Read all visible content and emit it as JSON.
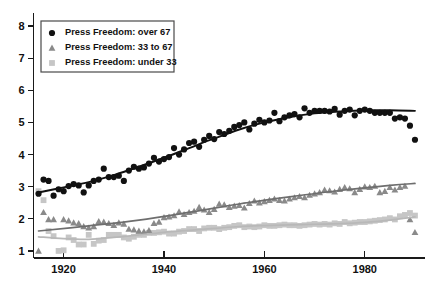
{
  "chart_data": {
    "type": "scatter",
    "title": "",
    "subtitle": "",
    "xlabel": "",
    "ylabel": "",
    "xlim": [
      1914,
      1992
    ],
    "ylim": [
      0.78,
      8.25
    ],
    "xticks": [
      1920,
      1940,
      1960,
      1980
    ],
    "xtick_labels": [
      "1920",
      "1940",
      "1960",
      "1980"
    ],
    "yticks": [
      1,
      2,
      3,
      4,
      5,
      6,
      7,
      8
    ],
    "ytick_labels": [
      "1",
      "2",
      "3",
      "4",
      "5",
      "6",
      "7",
      "8"
    ],
    "grid": false,
    "legend_position": "top-left",
    "series": [
      {
        "name": "Press Freedom: over 67",
        "legend_label": "Press Freedom: over 67",
        "marker": "circle",
        "color": "#111111",
        "trend_color": "#111111",
        "trend_width": 1.9,
        "x": [
          1915,
          1916,
          1917,
          1918,
          1919,
          1920,
          1921,
          1922,
          1923,
          1924,
          1925,
          1926,
          1927,
          1928,
          1929,
          1930,
          1931,
          1932,
          1933,
          1934,
          1935,
          1936,
          1937,
          1938,
          1939,
          1940,
          1941,
          1942,
          1943,
          1944,
          1945,
          1946,
          1947,
          1948,
          1949,
          1950,
          1951,
          1952,
          1953,
          1954,
          1955,
          1956,
          1957,
          1958,
          1959,
          1960,
          1961,
          1962,
          1963,
          1964,
          1965,
          1966,
          1967,
          1968,
          1969,
          1970,
          1971,
          1972,
          1973,
          1974,
          1975,
          1976,
          1977,
          1978,
          1979,
          1980,
          1981,
          1982,
          1983,
          1984,
          1985,
          1986,
          1987,
          1988,
          1989,
          1990
        ],
        "y": [
          2.78,
          3.22,
          3.18,
          2.72,
          2.92,
          2.86,
          3.02,
          3.08,
          3.04,
          2.82,
          3.04,
          3.18,
          3.22,
          3.56,
          3.3,
          3.3,
          3.34,
          3.18,
          3.5,
          3.62,
          3.56,
          3.6,
          3.72,
          3.9,
          3.78,
          3.86,
          3.92,
          4.2,
          4.0,
          4.16,
          4.36,
          4.4,
          4.24,
          4.46,
          4.58,
          4.48,
          4.7,
          4.64,
          4.74,
          4.86,
          4.92,
          5.0,
          4.78,
          4.96,
          5.08,
          5.0,
          5.06,
          5.3,
          5.04,
          5.16,
          5.22,
          5.26,
          5.16,
          5.44,
          5.3,
          5.36,
          5.36,
          5.36,
          5.34,
          5.42,
          5.24,
          5.36,
          5.4,
          5.22,
          5.36,
          5.4,
          5.36,
          5.3,
          5.3,
          5.3,
          5.3,
          5.12,
          5.16,
          5.12,
          4.9,
          4.46
        ],
        "trend": {
          "x": [
            1915,
            1920,
            1925,
            1930,
            1935,
            1940,
            1945,
            1950,
            1955,
            1960,
            1965,
            1970,
            1975,
            1980,
            1985,
            1990
          ],
          "y": [
            2.82,
            2.98,
            3.14,
            3.36,
            3.62,
            3.9,
            4.2,
            4.5,
            4.78,
            5.0,
            5.16,
            5.28,
            5.34,
            5.38,
            5.38,
            5.36
          ]
        }
      },
      {
        "name": "Press Freedom: 33 to 67",
        "legend_label": "Press Freedom: 33 to 67",
        "marker": "triangle",
        "color": "#8a8a8a",
        "trend_color": "#6e6e6e",
        "trend_width": 1.7,
        "x": [
          1915,
          1916,
          1917,
          1918,
          1920,
          1921,
          1922,
          1923,
          1924,
          1925,
          1926,
          1927,
          1928,
          1929,
          1930,
          1931,
          1932,
          1933,
          1934,
          1935,
          1936,
          1937,
          1938,
          1939,
          1940,
          1941,
          1942,
          1943,
          1944,
          1945,
          1946,
          1947,
          1948,
          1949,
          1950,
          1951,
          1952,
          1953,
          1954,
          1955,
          1956,
          1957,
          1958,
          1959,
          1960,
          1961,
          1962,
          1963,
          1964,
          1965,
          1966,
          1967,
          1968,
          1969,
          1970,
          1971,
          1972,
          1973,
          1974,
          1975,
          1976,
          1977,
          1978,
          1979,
          1980,
          1981,
          1982,
          1983,
          1984,
          1985,
          1986,
          1987,
          1988,
          1989,
          1990
        ],
        "y": [
          1.0,
          2.2,
          1.98,
          1.98,
          1.98,
          1.94,
          1.88,
          1.86,
          1.76,
          1.72,
          1.76,
          1.92,
          1.9,
          1.86,
          1.8,
          1.88,
          1.84,
          1.68,
          1.66,
          1.62,
          1.6,
          1.64,
          1.86,
          1.9,
          2.04,
          2.06,
          2.1,
          2.22,
          2.14,
          2.2,
          2.24,
          2.36,
          2.28,
          2.2,
          2.3,
          2.46,
          2.44,
          2.36,
          2.4,
          2.42,
          2.34,
          2.48,
          2.56,
          2.5,
          2.54,
          2.58,
          2.62,
          2.58,
          2.56,
          2.62,
          2.66,
          2.7,
          2.66,
          2.74,
          2.78,
          2.82,
          2.9,
          2.88,
          2.84,
          2.92,
          2.98,
          2.94,
          2.82,
          2.92,
          3.0,
          2.98,
          3.02,
          2.82,
          2.86,
          2.98,
          2.9,
          2.98,
          3.02,
          1.98,
          1.58
        ],
        "trend": {
          "x": [
            1915,
            1925,
            1935,
            1945,
            1955,
            1965,
            1975,
            1985,
            1990
          ],
          "y": [
            1.62,
            1.78,
            1.96,
            2.2,
            2.46,
            2.68,
            2.88,
            3.04,
            3.1
          ]
        }
      },
      {
        "name": "Press Freedom: under 33",
        "legend_label": "Press Freedom: under 33",
        "marker": "square",
        "color": "#c6c6c6",
        "trend_color": "#b8b8b8",
        "trend_width": 1.7,
        "x": [
          1915,
          1916,
          1917,
          1918,
          1919,
          1920,
          1921,
          1922,
          1923,
          1924,
          1925,
          1926,
          1927,
          1928,
          1929,
          1930,
          1931,
          1932,
          1933,
          1934,
          1935,
          1936,
          1937,
          1938,
          1939,
          1940,
          1941,
          1942,
          1943,
          1944,
          1945,
          1946,
          1947,
          1948,
          1949,
          1950,
          1951,
          1952,
          1953,
          1954,
          1955,
          1956,
          1957,
          1958,
          1959,
          1960,
          1961,
          1962,
          1963,
          1964,
          1965,
          1966,
          1967,
          1968,
          1969,
          1970,
          1971,
          1972,
          1973,
          1974,
          1975,
          1976,
          1977,
          1978,
          1979,
          1980,
          1981,
          1982,
          1983,
          1984,
          1985,
          1986,
          1987,
          1988,
          1989,
          1990
        ],
        "y": [
          2.86,
          2.58,
          1.62,
          1.46,
          1.0,
          1.02,
          1.42,
          1.34,
          1.2,
          1.2,
          1.5,
          1.22,
          1.32,
          1.34,
          1.5,
          1.5,
          1.5,
          1.42,
          1.38,
          1.44,
          1.5,
          1.5,
          1.56,
          1.56,
          1.58,
          1.6,
          1.54,
          1.54,
          1.6,
          1.62,
          1.68,
          1.68,
          1.62,
          1.7,
          1.72,
          1.72,
          1.68,
          1.72,
          1.74,
          1.78,
          1.8,
          1.74,
          1.76,
          1.74,
          1.76,
          1.8,
          1.78,
          1.78,
          1.8,
          1.82,
          1.8,
          1.8,
          1.78,
          1.8,
          1.82,
          1.84,
          1.82,
          1.84,
          1.82,
          1.86,
          1.84,
          1.9,
          1.86,
          1.88,
          1.9,
          1.9,
          1.92,
          1.94,
          1.96,
          1.98,
          2.02,
          1.98,
          2.08,
          2.12,
          2.18,
          2.1
        ],
        "trend": {
          "x": [
            1915,
            1920,
            1925,
            1930,
            1935,
            1940,
            1945,
            1950,
            1955,
            1960,
            1965,
            1970,
            1975,
            1980,
            1985,
            1990
          ],
          "y": [
            1.44,
            1.38,
            1.36,
            1.42,
            1.5,
            1.58,
            1.64,
            1.7,
            1.76,
            1.79,
            1.81,
            1.83,
            1.85,
            1.89,
            1.96,
            2.06
          ]
        }
      }
    ]
  },
  "legend": {
    "items": [
      {
        "marker": "circle",
        "label": "Press Freedom: over 67",
        "color": "#111111"
      },
      {
        "marker": "triangle",
        "label": "Press Freedom: 33 to 67",
        "color": "#8a8a8a"
      },
      {
        "marker": "square",
        "label": "Press Freedom: under 33",
        "color": "#c6c6c6"
      }
    ]
  }
}
